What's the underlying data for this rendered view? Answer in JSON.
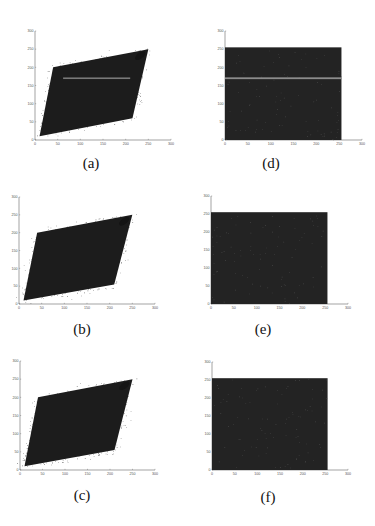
{
  "figure": {
    "panels": [
      {
        "id": "a",
        "caption": "(a)",
        "type": "scatter",
        "variant": "joint-cloud-with-band"
      },
      {
        "id": "d",
        "caption": "(d)",
        "type": "scatter",
        "variant": "uniform-square-with-band"
      },
      {
        "id": "b",
        "caption": "(b)",
        "type": "scatter",
        "variant": "joint-cloud"
      },
      {
        "id": "e",
        "caption": "(e)",
        "type": "scatter",
        "variant": "uniform-square"
      },
      {
        "id": "c",
        "caption": "(c)",
        "type": "scatter",
        "variant": "joint-cloud"
      },
      {
        "id": "f",
        "caption": "(f)",
        "type": "scatter",
        "variant": "uniform-square"
      }
    ],
    "axis_ticks": [
      "0",
      "50",
      "100",
      "150",
      "200",
      "250",
      "300"
    ]
  },
  "chart_data": [
    {
      "panel": "a",
      "type": "scatter",
      "title": "(a)",
      "xlabel": "",
      "ylabel": "",
      "xlim": [
        0,
        300
      ],
      "ylim": [
        0,
        300
      ],
      "xticks": [
        0,
        50,
        100,
        150,
        200,
        250,
        300
      ],
      "yticks": [
        0,
        50,
        100,
        150,
        200,
        250,
        300
      ],
      "grid": false,
      "description": "Dense correlated point cloud of adjacent-pixel intensity pairs, parallelogram shaped from about (10,10) to (250,250), with a lighter horizontal band near y=170 spanning x≈60–210",
      "shape_vertices": [
        [
          10,
          10
        ],
        [
          40,
          200
        ],
        [
          250,
          250
        ],
        [
          215,
          60
        ]
      ],
      "band_y": 170
    },
    {
      "panel": "d",
      "type": "scatter",
      "title": "(d)",
      "xlabel": "",
      "ylabel": "",
      "xlim": [
        0,
        300
      ],
      "ylim": [
        0,
        300
      ],
      "xticks": [
        0,
        50,
        100,
        150,
        200,
        250,
        300
      ],
      "yticks": [
        0,
        50,
        100,
        150,
        200,
        250,
        300
      ],
      "grid": false,
      "description": "Uniformly filled square from 0 to 255 on both axes with a light horizontal line near y=170",
      "fill_range": [
        0,
        255
      ],
      "band_y": 170
    },
    {
      "panel": "b",
      "type": "scatter",
      "title": "(b)",
      "xlabel": "",
      "ylabel": "",
      "xlim": [
        0,
        300
      ],
      "ylim": [
        0,
        300
      ],
      "xticks": [
        0,
        50,
        100,
        150,
        200,
        250,
        300
      ],
      "yticks": [
        0,
        50,
        100,
        150,
        200,
        250,
        300
      ],
      "grid": false,
      "description": "Dense correlated point cloud, parallelogram from about (10,10) to (250,250)",
      "shape_vertices": [
        [
          10,
          10
        ],
        [
          40,
          200
        ],
        [
          250,
          250
        ],
        [
          210,
          55
        ]
      ]
    },
    {
      "panel": "e",
      "type": "scatter",
      "title": "(e)",
      "xlabel": "",
      "ylabel": "",
      "xlim": [
        0,
        300
      ],
      "ylim": [
        0,
        300
      ],
      "xticks": [
        0,
        50,
        100,
        150,
        200,
        250,
        300
      ],
      "yticks": [
        0,
        50,
        100,
        150,
        200,
        250,
        300
      ],
      "grid": false,
      "description": "Uniformly filled square from 0 to 255 on both axes",
      "fill_range": [
        0,
        255
      ]
    },
    {
      "panel": "c",
      "type": "scatter",
      "title": "(c)",
      "xlabel": "",
      "ylabel": "",
      "xlim": [
        0,
        300
      ],
      "ylim": [
        0,
        300
      ],
      "xticks": [
        0,
        50,
        100,
        150,
        200,
        250,
        300
      ],
      "yticks": [
        0,
        50,
        100,
        150,
        200,
        250,
        300
      ],
      "grid": false,
      "description": "Dense correlated point cloud, parallelogram from about (10,10) to (250,250)",
      "shape_vertices": [
        [
          10,
          10
        ],
        [
          40,
          200
        ],
        [
          250,
          250
        ],
        [
          210,
          55
        ]
      ]
    },
    {
      "panel": "f",
      "type": "scatter",
      "title": "(f)",
      "xlabel": "",
      "ylabel": "",
      "xlim": [
        0,
        300
      ],
      "ylim": [
        0,
        300
      ],
      "xticks": [
        0,
        50,
        100,
        150,
        200,
        250,
        300
      ],
      "yticks": [
        0,
        50,
        100,
        150,
        200,
        250,
        300
      ],
      "grid": false,
      "description": "Uniformly filled square from 0 to 255 on both axes",
      "fill_range": [
        0,
        255
      ]
    }
  ]
}
